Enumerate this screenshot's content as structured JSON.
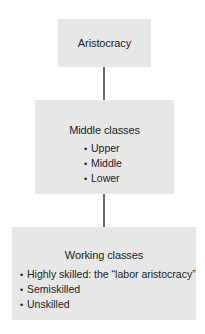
{
  "diagram": {
    "type": "hierarchy",
    "colors": {
      "box_fill": "#e7e7e7",
      "connector": "#6a6a6a",
      "text": "#222222"
    },
    "nodes": [
      {
        "title": "Aristocracy",
        "items": []
      },
      {
        "title": "Middle classes",
        "items": [
          "Upper",
          "Middle",
          "Lower"
        ]
      },
      {
        "title": "Working classes",
        "items": [
          "Highly skilled: the “labor aristocracy”",
          "Semiskilled",
          "Unskilled"
        ]
      }
    ],
    "edges": [
      {
        "from": "Aristocracy",
        "to": "Middle classes"
      },
      {
        "from": "Middle classes",
        "to": "Working classes"
      }
    ]
  }
}
